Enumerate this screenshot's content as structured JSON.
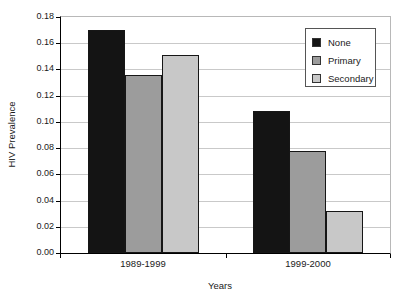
{
  "chart_data": {
    "type": "bar",
    "title": "",
    "xlabel": "Years",
    "ylabel": "HIV Prevalence",
    "categories": [
      "1989-1999",
      "1999-2000"
    ],
    "series": [
      {
        "name": "None",
        "color": "#141414",
        "values": [
          0.17,
          0.108
        ]
      },
      {
        "name": "Primary",
        "color": "#9c9c9c",
        "values": [
          0.136,
          0.078
        ]
      },
      {
        "name": "Secondary",
        "color": "#c8c8c8",
        "values": [
          0.151,
          0.032
        ]
      }
    ],
    "ylim": [
      0,
      0.18
    ],
    "ytick_step": 0.02,
    "ytick_labels": [
      "0.00",
      "0.02",
      "0.04",
      "0.06",
      "0.08",
      "0.10",
      "0.12",
      "0.14",
      "0.16",
      "0.18"
    ],
    "grid": true,
    "gridline_color": "#c9c9c9",
    "legend_position": "top-right",
    "background_color": "#ffffff"
  }
}
